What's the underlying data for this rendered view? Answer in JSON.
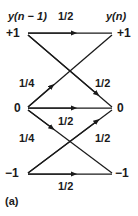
{
  "figure": {
    "caption": "(a)",
    "headers": {
      "left": "y(n − 1)",
      "top_weight": "1/2",
      "right": "y(n)"
    },
    "states": {
      "left": [
        "+1",
        "0",
        "−1"
      ],
      "right": [
        "+1",
        "0",
        "−1"
      ]
    },
    "node_labels": {
      "left_plus1": "+1",
      "left_zero": "0",
      "left_minus1": "−1",
      "right_plus1": "+1",
      "right_zero": "0",
      "right_minus1": "−1"
    },
    "transitions": [
      {
        "from": "+1",
        "to": "+1",
        "weight": "1/2",
        "label_position": "top"
      },
      {
        "from": "+1",
        "to": "0",
        "weight": "1/2",
        "label_position": "right-upper"
      },
      {
        "from": "0",
        "to": "+1",
        "weight": "1/4",
        "label_position": "left-upper"
      },
      {
        "from": "0",
        "to": "0",
        "weight": "1/2",
        "label_position": "middle"
      },
      {
        "from": "0",
        "to": "−1",
        "weight": "1/4",
        "label_position": "left-lower"
      },
      {
        "from": "−1",
        "to": "0",
        "weight": "1/2",
        "label_position": "right-lower"
      },
      {
        "from": "−1",
        "to": "−1",
        "weight": "1/2",
        "label_position": "bottom"
      }
    ],
    "weights": {
      "top": "1/2",
      "left_upper": "1/4",
      "right_upper": "1/2",
      "middle": "1/2",
      "left_lower": "1/4",
      "right_lower": "1/2",
      "bottom": "1/2"
    },
    "colors": {
      "line": "#1a1a1a",
      "text": "#1a1a1a",
      "background": "#ffffff"
    }
  }
}
